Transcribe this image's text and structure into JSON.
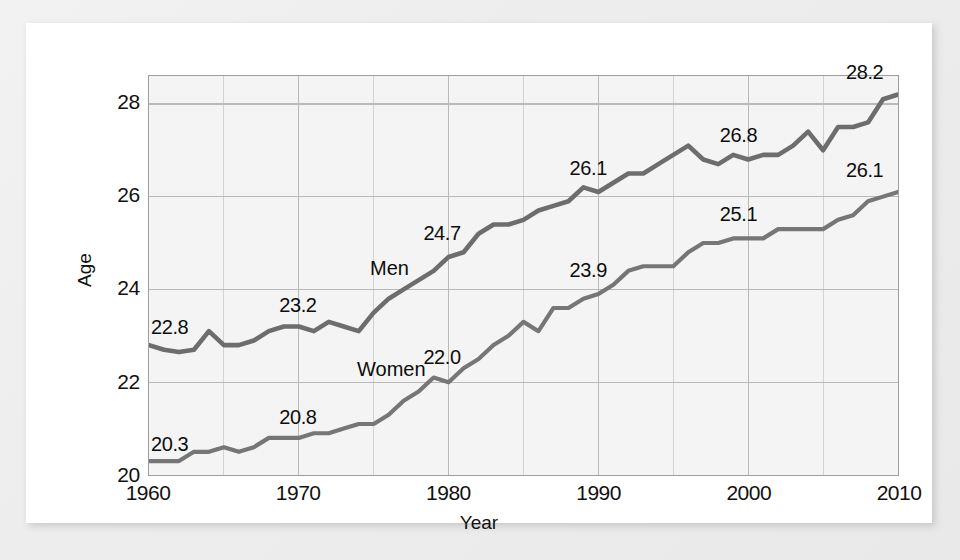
{
  "chart_data": {
    "type": "line",
    "title": "",
    "subtitle": "",
    "xlabel": "Year",
    "ylabel": "Age",
    "xlim": [
      1960,
      2010
    ],
    "ylim": [
      20,
      28.6
    ],
    "grid": true,
    "grid_major_x": [
      1960,
      1970,
      1980,
      1990,
      2000,
      2010
    ],
    "grid_minor_x": [
      1965,
      1975,
      1985,
      1995,
      2005
    ],
    "grid_major_y": [
      20,
      22,
      24,
      26,
      28
    ],
    "xticks": [
      "1960",
      "1970",
      "1980",
      "1990",
      "2000",
      "2010"
    ],
    "yticks": [
      "20",
      "22",
      "24",
      "26",
      "28"
    ],
    "legend_position": "inline-series-labels",
    "series": [
      {
        "name": "Men",
        "color": "#6d6d6d",
        "x": [
          1960,
          1961,
          1962,
          1963,
          1964,
          1965,
          1966,
          1967,
          1968,
          1969,
          1970,
          1971,
          1972,
          1973,
          1974,
          1975,
          1976,
          1977,
          1978,
          1979,
          1980,
          1981,
          1982,
          1983,
          1984,
          1985,
          1986,
          1987,
          1988,
          1989,
          1990,
          1991,
          1992,
          1993,
          1994,
          1995,
          1996,
          1997,
          1998,
          1999,
          2000,
          2001,
          2002,
          2003,
          2004,
          2005,
          2006,
          2007,
          2008,
          2009,
          2010
        ],
        "values": [
          22.8,
          22.7,
          22.65,
          22.7,
          23.1,
          22.8,
          22.8,
          22.9,
          23.1,
          23.2,
          23.2,
          23.1,
          23.3,
          23.2,
          23.1,
          23.5,
          23.8,
          24.0,
          24.2,
          24.4,
          24.7,
          24.8,
          25.2,
          25.4,
          25.4,
          25.5,
          25.7,
          25.8,
          25.9,
          26.2,
          26.1,
          26.3,
          26.5,
          26.5,
          26.7,
          26.9,
          27.1,
          26.8,
          26.7,
          26.9,
          26.8,
          26.9,
          26.9,
          27.1,
          27.4,
          27.0,
          27.5,
          27.5,
          27.6,
          28.1,
          28.2
        ],
        "labeled_points": [
          {
            "year": 1960,
            "value": "22.8"
          },
          {
            "year": 1970,
            "value": "23.2"
          },
          {
            "year": 1980,
            "value": "24.7"
          },
          {
            "year": 1990,
            "value": "26.1"
          },
          {
            "year": 2000,
            "value": "26.8"
          },
          {
            "year": 2010,
            "value": "28.2"
          }
        ]
      },
      {
        "name": "Women",
        "color": "#767676",
        "x": [
          1960,
          1961,
          1962,
          1963,
          1964,
          1965,
          1966,
          1967,
          1968,
          1969,
          1970,
          1971,
          1972,
          1973,
          1974,
          1975,
          1976,
          1977,
          1978,
          1979,
          1980,
          1981,
          1982,
          1983,
          1984,
          1985,
          1986,
          1987,
          1988,
          1989,
          1990,
          1991,
          1992,
          1993,
          1994,
          1995,
          1996,
          1997,
          1998,
          1999,
          2000,
          2001,
          2002,
          2003,
          2004,
          2005,
          2006,
          2007,
          2008,
          2009,
          2010
        ],
        "values": [
          20.3,
          20.3,
          20.3,
          20.5,
          20.5,
          20.6,
          20.5,
          20.6,
          20.8,
          20.8,
          20.8,
          20.9,
          20.9,
          21.0,
          21.1,
          21.1,
          21.3,
          21.6,
          21.8,
          22.1,
          22.0,
          22.3,
          22.5,
          22.8,
          23.0,
          23.3,
          23.1,
          23.6,
          23.6,
          23.8,
          23.9,
          24.1,
          24.4,
          24.5,
          24.5,
          24.5,
          24.8,
          25.0,
          25.0,
          25.1,
          25.1,
          25.1,
          25.3,
          25.3,
          25.3,
          25.3,
          25.5,
          25.6,
          25.9,
          26.0,
          26.1
        ],
        "labeled_points": [
          {
            "year": 1960,
            "value": "20.3"
          },
          {
            "year": 1970,
            "value": "20.8"
          },
          {
            "year": 1980,
            "value": "22.0"
          },
          {
            "year": 1990,
            "value": "23.9"
          },
          {
            "year": 2000,
            "value": "25.1"
          },
          {
            "year": 2010,
            "value": "26.1"
          }
        ]
      }
    ]
  },
  "annotations": {
    "men_label": "Men",
    "women_label": "Women"
  },
  "colors": {
    "plot_background": "#f4f4f4",
    "gridline": "#b9b9b9",
    "axis_border": "#9e9e9e",
    "men_line": "#6d6d6d",
    "women_line": "#767676",
    "text": "#111111",
    "card_background": "#ffffff"
  }
}
